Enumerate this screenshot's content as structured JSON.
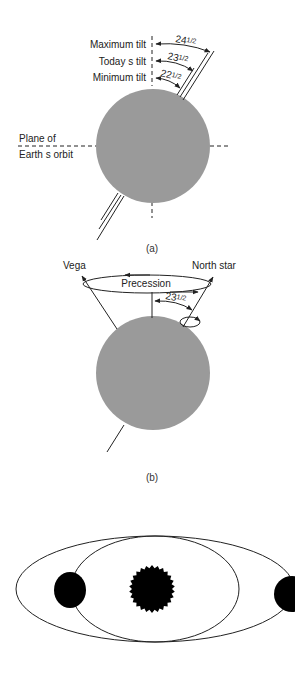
{
  "colors": {
    "earth": "#9a9a9a",
    "line": "#222222",
    "dark": "#000000",
    "background": "#ffffff"
  },
  "panel_a": {
    "caption": "(a)",
    "labels": {
      "max_tilt": "Maximum tilt",
      "today_tilt": "Today s tilt",
      "min_tilt": "Minimum tilt",
      "plane_line1": "Plane of",
      "plane_line2": "Earth s orbit"
    },
    "angles": {
      "max": {
        "whole": "24",
        "frac": "1/2"
      },
      "today": {
        "whole": "23",
        "frac": "1/2"
      },
      "min": {
        "whole": "22",
        "frac": "1/2"
      }
    }
  },
  "panel_b": {
    "caption": "(b)",
    "labels": {
      "vega": "Vega",
      "north_star": "North star",
      "precession": "Precession"
    },
    "angle": {
      "whole": "23",
      "frac": "1/2"
    }
  },
  "panel_c": {
    "description": "Sun with two orbital ellipses (circular and elongated) and planet positions"
  }
}
